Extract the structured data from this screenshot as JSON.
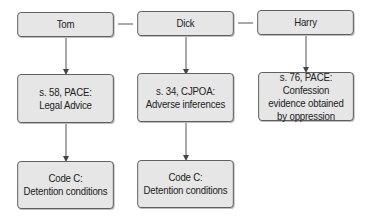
{
  "diagram": {
    "colors": {
      "box_fill": "#e6e6e6",
      "box_border": "#5a5a5a",
      "line": "#555555"
    },
    "columns": [
      {
        "header": "Tom",
        "nodes": [
          "s. 58, PACE:\nLegal Advice",
          "Code C:\nDetention conditions"
        ]
      },
      {
        "header": "Dick",
        "nodes": [
          "s. 34, CJPOA:\nAdverse inferences",
          "Code C:\nDetention conditions"
        ]
      },
      {
        "header": "Harry",
        "nodes": [
          "s. 76, PACE: Confession\nevidence obtained\nby oppression"
        ]
      }
    ],
    "edges": [
      [
        "Tom",
        "Dick"
      ],
      [
        "Dick",
        "Harry"
      ],
      [
        "Tom",
        "s. 58, PACE: Legal Advice"
      ],
      [
        "s. 58, PACE: Legal Advice",
        "Code C: Detention conditions"
      ],
      [
        "Dick",
        "s. 34, CJPOA: Adverse inferences"
      ],
      [
        "s. 34, CJPOA: Adverse inferences",
        "Code C: Detention conditions"
      ],
      [
        "Harry",
        "s. 76, PACE: Confession evidence obtained by oppression"
      ]
    ]
  }
}
